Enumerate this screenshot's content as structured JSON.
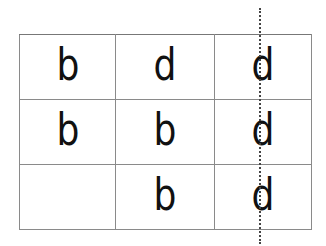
{
  "grid": {
    "rows": [
      [
        "b",
        "d",
        "d"
      ],
      [
        "b",
        "b",
        "d"
      ],
      [
        "",
        "b",
        "d"
      ]
    ]
  },
  "line": {
    "style": "dotted",
    "orientation": "vertical",
    "color": "#444444"
  }
}
